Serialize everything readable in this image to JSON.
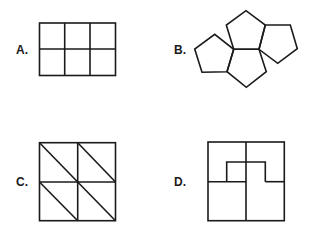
{
  "options": [
    {
      "label": "A.",
      "figure": "rectangle divided into 2 rows x 3 columns of squares"
    },
    {
      "label": "B.",
      "figure": "four pentagons joined edge-to-edge"
    },
    {
      "label": "C.",
      "figure": "square divided into 4 squares, each split by a diagonal into two triangles"
    },
    {
      "label": "D.",
      "figure": "square divided into 4 squares with an inner raised rectangular notch"
    }
  ],
  "colors": {
    "stroke": "#1a1a1a",
    "background": "#ffffff"
  }
}
